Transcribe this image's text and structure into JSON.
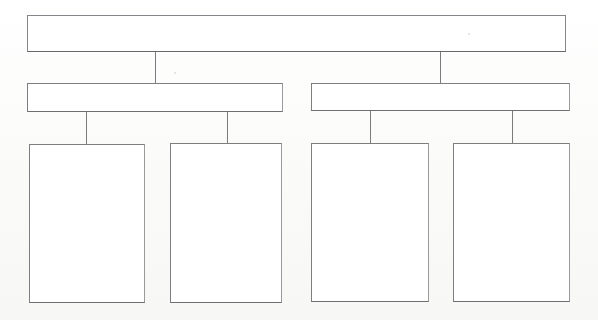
{
  "diagram": {
    "type": "organizational-tree",
    "orientation": "top-down",
    "levels": 3,
    "background_color": "#fdfdfc",
    "stroke_color": "#7e7e80",
    "fill_color": "#ffffff",
    "medium": "hand-drawn-scan",
    "nodes": [
      {
        "id": "root",
        "level": 1,
        "label": "",
        "x": 27,
        "y": 15,
        "width": 539,
        "height": 37
      },
      {
        "id": "branch-left",
        "level": 2,
        "label": "",
        "x": 27,
        "y": 83,
        "width": 256,
        "height": 29
      },
      {
        "id": "branch-right",
        "level": 2,
        "label": "",
        "x": 311,
        "y": 83,
        "width": 259,
        "height": 28
      },
      {
        "id": "leaf-1",
        "level": 3,
        "label": "",
        "x": 29,
        "y": 144,
        "width": 116,
        "height": 159
      },
      {
        "id": "leaf-2",
        "level": 3,
        "label": "",
        "x": 170,
        "y": 143,
        "width": 112,
        "height": 160
      },
      {
        "id": "leaf-3",
        "level": 3,
        "label": "",
        "x": 311,
        "y": 143,
        "width": 118,
        "height": 159
      },
      {
        "id": "leaf-4",
        "level": 3,
        "label": "",
        "x": 453,
        "y": 143,
        "width": 117,
        "height": 159
      }
    ],
    "connectors": [
      {
        "id": "root-to-branch-left",
        "from": "root",
        "to": "branch-left",
        "x": 155,
        "y": 52,
        "length": 31
      },
      {
        "id": "root-to-branch-right",
        "from": "root",
        "to": "branch-right",
        "x": 440,
        "y": 52,
        "length": 31
      },
      {
        "id": "branch-left-to-leaf-1",
        "from": "branch-left",
        "to": "leaf-1",
        "x": 86,
        "y": 112,
        "length": 32
      },
      {
        "id": "branch-left-to-leaf-2",
        "from": "branch-left",
        "to": "leaf-2",
        "x": 227,
        "y": 112,
        "length": 31
      },
      {
        "id": "branch-right-to-leaf-3",
        "from": "branch-right",
        "to": "leaf-3",
        "x": 370,
        "y": 111,
        "length": 32
      },
      {
        "id": "branch-right-to-leaf-4",
        "from": "branch-right",
        "to": "leaf-4",
        "x": 512,
        "y": 111,
        "length": 32
      }
    ],
    "artifacts": [
      {
        "id": "speck-upper-right",
        "x": 468,
        "y": 33,
        "size": "tiny"
      },
      {
        "id": "speck-mid-left",
        "x": 174,
        "y": 72,
        "size": "tiny"
      }
    ]
  }
}
